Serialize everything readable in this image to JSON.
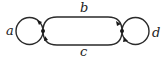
{
  "diagram": {
    "type": "graph",
    "vertices": [
      {
        "id": "u",
        "x": 43,
        "y": 31
      },
      {
        "id": "v",
        "x": 122,
        "y": 31
      }
    ],
    "edges": [
      {
        "label": "a",
        "kind": "loop",
        "at": "u"
      },
      {
        "label": "b",
        "kind": "edge",
        "from": "u",
        "to": "v",
        "side": "top"
      },
      {
        "label": "c",
        "kind": "edge",
        "from": "u",
        "to": "v",
        "side": "bottom"
      },
      {
        "label": "d",
        "kind": "loop",
        "at": "v"
      }
    ],
    "labels": {
      "a": "a",
      "b": "b",
      "c": "c",
      "d": "d"
    },
    "stroke_color": "#2a2a2a",
    "background": "#ffffff"
  }
}
